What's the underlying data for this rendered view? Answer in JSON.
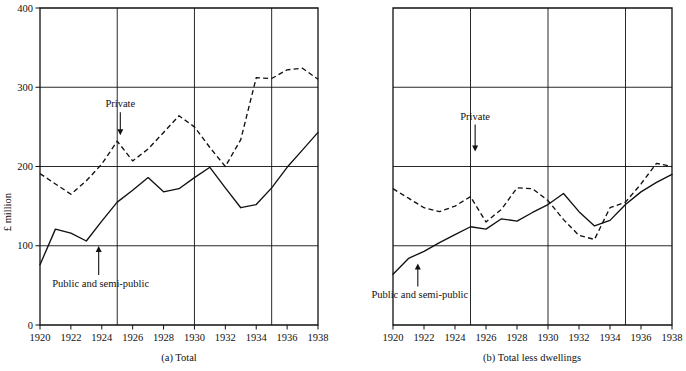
{
  "figure": {
    "ylabel": "£ million",
    "panels": [
      {
        "id": "a",
        "caption": "(a) Total",
        "annotations": [
          {
            "name": "private",
            "text": "Private"
          },
          {
            "name": "public",
            "text": "Public and semi-public"
          }
        ]
      },
      {
        "id": "b",
        "caption": "(b) Total less dwellings",
        "annotations": [
          {
            "name": "private",
            "text": "Private"
          },
          {
            "name": "public",
            "text": "Public and semi-public"
          }
        ]
      }
    ]
  },
  "chart_data": [
    {
      "type": "line",
      "title": "(a) Total",
      "xlabel": "",
      "ylabel": "£ million",
      "xlim": [
        1920,
        1938
      ],
      "ylim": [
        0,
        400
      ],
      "ytick_labels": [
        "0",
        "100",
        "200",
        "300",
        "400"
      ],
      "yticks": [
        0,
        100,
        200,
        300,
        400
      ],
      "xtick_labels": [
        "1920",
        "1922",
        "1924",
        "1926",
        "1928",
        "1930",
        "1932",
        "1934",
        "1936",
        "1938"
      ],
      "xticks": [
        1920,
        1922,
        1924,
        1926,
        1928,
        1930,
        1932,
        1934,
        1936,
        1938
      ],
      "x_gridlines": [
        1925,
        1930,
        1935
      ],
      "y_gridlines": [
        100,
        200,
        300
      ],
      "grid": true,
      "legend": "annotated-arrows",
      "x": [
        1920,
        1921,
        1922,
        1923,
        1924,
        1925,
        1926,
        1927,
        1928,
        1929,
        1930,
        1931,
        1932,
        1933,
        1934,
        1935,
        1936,
        1937,
        1938
      ],
      "series": [
        {
          "name": "Private",
          "style": "dashed",
          "values": [
            191,
            178,
            165,
            182,
            203,
            232,
            207,
            222,
            243,
            264,
            250,
            224,
            200,
            234,
            312,
            311,
            322,
            324,
            310
          ]
        },
        {
          "name": "Public and semi-public",
          "style": "solid",
          "values": [
            76,
            121,
            116,
            106,
            131,
            155,
            170,
            186,
            168,
            172,
            186,
            199,
            173,
            148,
            152,
            173,
            199,
            221,
            243
          ]
        }
      ]
    },
    {
      "type": "line",
      "title": "(b) Total less dwellings",
      "xlabel": "",
      "ylabel": "£ million",
      "xlim": [
        1920,
        1938
      ],
      "ylim": [
        0,
        400
      ],
      "ytick_labels": [],
      "yticks": [
        0,
        100,
        200,
        300,
        400
      ],
      "xtick_labels": [
        "1920",
        "1922",
        "1924",
        "1926",
        "1928",
        "1930",
        "1932",
        "1934",
        "1936",
        "1938"
      ],
      "xticks": [
        1920,
        1922,
        1924,
        1926,
        1928,
        1930,
        1932,
        1934,
        1936,
        1938
      ],
      "x_gridlines": [
        1925,
        1930,
        1935
      ],
      "y_gridlines": [
        100,
        200,
        300
      ],
      "grid": true,
      "legend": "annotated-arrows",
      "x": [
        1920,
        1921,
        1922,
        1923,
        1924,
        1925,
        1926,
        1927,
        1928,
        1929,
        1930,
        1931,
        1932,
        1933,
        1934,
        1935,
        1936,
        1937,
        1938
      ],
      "series": [
        {
          "name": "Private",
          "style": "dashed",
          "values": [
            172,
            160,
            148,
            143,
            150,
            162,
            130,
            146,
            173,
            172,
            157,
            133,
            113,
            108,
            148,
            155,
            178,
            204,
            200
          ]
        },
        {
          "name": "Public and semi-public",
          "style": "solid",
          "values": [
            64,
            84,
            93,
            104,
            114,
            124,
            121,
            134,
            131,
            142,
            152,
            166,
            143,
            125,
            132,
            152,
            168,
            180,
            190
          ]
        }
      ]
    }
  ]
}
